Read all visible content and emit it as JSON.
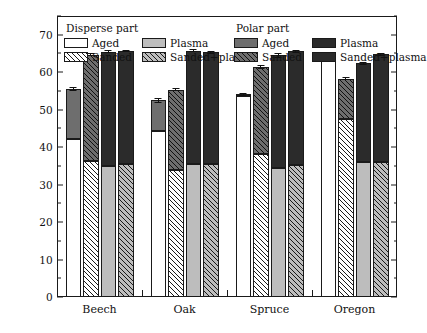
{
  "chart_data": {
    "type": "bar",
    "subtype": "grouped-stacked",
    "title": "",
    "xlabel": "",
    "ylabel": "Surface energy (mN/m⁻)",
    "ylim": [
      0,
      75
    ],
    "yticks": [
      0,
      10,
      20,
      30,
      40,
      50,
      60,
      70
    ],
    "ytick_labels": [
      "0",
      "10",
      "20",
      "30",
      "40",
      "50",
      "60",
      "70"
    ],
    "yminor_step": 5,
    "grid": false,
    "legend_position": "inside-top",
    "categories": [
      "Beech",
      "Oak",
      "Spruce",
      "Oregon"
    ],
    "treatments": [
      "Aged",
      "Sanded",
      "Plasma",
      "Sanded+plasma"
    ],
    "stack_parts": [
      "Disperse part",
      "Polar part"
    ],
    "series": [
      {
        "name": "Disperse part",
        "values_by_category": {
          "Beech": [
            42.3,
            36.2,
            35.0,
            35.4
          ],
          "Oak": [
            44.3,
            33.9,
            35.4,
            35.5
          ],
          "Spruce": [
            53.6,
            38.2,
            34.5,
            35.2
          ],
          "Oregon": [
            63.4,
            47.6,
            36.0,
            36.0
          ]
        }
      },
      {
        "name": "Polar part",
        "values_by_category": {
          "Beech": [
            13.2,
            28.5,
            30.5,
            30.3
          ],
          "Oak": [
            8.2,
            21.4,
            30.3,
            29.8
          ],
          "Spruce": [
            0.4,
            23.2,
            30.0,
            30.4
          ],
          "Oregon": [
            0.4,
            10.6,
            26.4,
            28.8
          ]
        }
      }
    ],
    "totals_by_category": {
      "Beech": [
        55.5,
        64.7,
        65.5,
        65.7
      ],
      "Oak": [
        52.5,
        55.3,
        65.7,
        65.3
      ],
      "Spruce": [
        54.0,
        61.4,
        64.5,
        65.6
      ],
      "Oregon": [
        63.8,
        58.2,
        62.4,
        64.8
      ]
    },
    "errors_by_category": {
      "Beech": [
        0.5,
        0.4,
        0.4,
        0.3
      ],
      "Oak": [
        0.6,
        0.4,
        0.4,
        0.4
      ],
      "Spruce": [
        0.4,
        0.5,
        0.6,
        0.4
      ],
      "Oregon": [
        0.6,
        0.4,
        0.4,
        0.4
      ]
    }
  },
  "legend": {
    "groups": [
      {
        "title": "Disperse part",
        "entries": [
          {
            "label": "Aged",
            "fill": "f-white"
          },
          {
            "label": "Plasma",
            "fill": "f-lgray"
          },
          {
            "label": "Sanded",
            "fill": "f-hatch-white"
          },
          {
            "label": "Sanded+plasma",
            "fill": "f-hatch-lgray"
          }
        ]
      },
      {
        "title": "Polar part",
        "entries": [
          {
            "label": "Aged",
            "fill": "f-dgray"
          },
          {
            "label": "Plasma",
            "fill": "f-black"
          },
          {
            "label": "Sanded",
            "fill": "f-hatch-dgray"
          },
          {
            "label": "Sanded+plasma",
            "fill": "f-black"
          }
        ]
      }
    ]
  },
  "axis": {
    "y_title": "Surface energy (mN/m⁻)",
    "y_tick_labels": [
      "0",
      "10",
      "20",
      "30",
      "40",
      "50",
      "60",
      "70"
    ],
    "x_tick_labels": [
      "Beech",
      "Oak",
      "Spruce",
      "Oregon"
    ]
  },
  "colors": {
    "disperse_aged": "#ffffff",
    "disperse_plasma": "#bdbdbd",
    "polar_aged": "#6e6e6e",
    "polar_plasma": "#2b2b2b",
    "axis": "#1a1a1a"
  }
}
